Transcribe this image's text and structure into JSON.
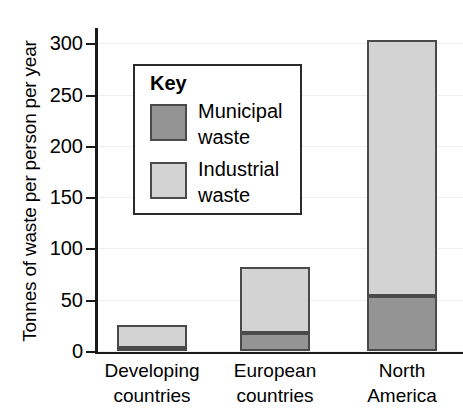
{
  "chart_data": {
    "type": "bar",
    "stacked": true,
    "title": "",
    "xlabel": "",
    "ylabel": "Tonnes of waste per person per year",
    "ylim": [
      0,
      310
    ],
    "yticks": [
      0,
      50,
      100,
      150,
      200,
      250,
      300
    ],
    "ytick_labels": [
      "0",
      "50",
      "100",
      "150",
      "200",
      "250",
      "300"
    ],
    "grid": true,
    "legend_position": "inside-upper-left",
    "legend_title": "Key",
    "categories": [
      "Developing countries",
      "European countries",
      "North America"
    ],
    "category_lines": [
      [
        "Developing",
        "countries"
      ],
      [
        "European",
        "countries"
      ],
      [
        "North",
        "America"
      ]
    ],
    "series": [
      {
        "name": "Municipal waste",
        "name_lines": [
          "Municipal",
          "waste"
        ],
        "color": "#949494",
        "values": [
          3,
          18,
          54
        ]
      },
      {
        "name": "Industrial waste",
        "name_lines": [
          "Industrial",
          "waste"
        ],
        "color": "#d3d3d3",
        "values": [
          22,
          64,
          249
        ]
      }
    ],
    "totals": [
      25,
      82,
      303
    ],
    "colors": {
      "municipal": "#949494",
      "industrial": "#d3d3d3",
      "bar_outline": "#4a4a4a",
      "axis": "#1a1a1a",
      "gridline": "#efefef",
      "background": "#ffffff"
    }
  },
  "axis": {
    "y_title": "Tonnes of waste per person per year"
  },
  "legend": {
    "title": "Key",
    "items": [
      {
        "label_line1": "Municipal",
        "label_line2": "waste"
      },
      {
        "label_line1": "Industrial",
        "label_line2": "waste"
      }
    ]
  },
  "x_axis": {
    "labels": [
      {
        "line1": "Developing",
        "line2": "countries"
      },
      {
        "line1": "European",
        "line2": "countries"
      },
      {
        "line1": "North",
        "line2": "America"
      }
    ]
  }
}
